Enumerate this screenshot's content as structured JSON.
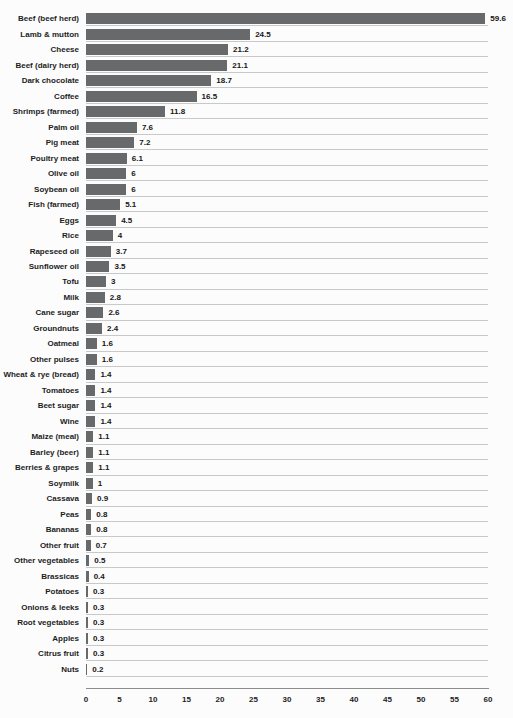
{
  "chart_data": {
    "type": "bar",
    "orientation": "horizontal",
    "title": "",
    "xlabel": "",
    "ylabel": "",
    "xlim": [
      0,
      60
    ],
    "x_ticks": [
      0,
      5,
      10,
      15,
      20,
      25,
      30,
      35,
      40,
      45,
      50,
      55,
      60
    ],
    "grid": "horizontal row separator lines only, no vertical gridlines",
    "legend_position": "none",
    "bar_color": "#68696b",
    "separator_color": "#c9c9c9",
    "axis_line_color": "#8d8d8d",
    "categories": [
      "Beef (beef herd)",
      "Lamb & mutton",
      "Cheese",
      "Beef (dairy herd)",
      "Dark chocolate",
      "Coffee",
      "Shrimps (farmed)",
      "Palm oil",
      "Pig meat",
      "Poultry meat",
      "Olive oil",
      "Soybean oil",
      "Fish (farmed)",
      "Eggs",
      "Rice",
      "Rapeseed oil",
      "Sunflower oil",
      "Tofu",
      "Milk",
      "Cane sugar",
      "Groundnuts",
      "Oatmeal",
      "Other pulses",
      "Wheat & rye (bread)",
      "Tomatoes",
      "Beet sugar",
      "Wine",
      "Maize (meal)",
      "Barley (beer)",
      "Berries & grapes",
      "Soymilk",
      "Cassava",
      "Peas",
      "Bananas",
      "Other fruit",
      "Other vegetables",
      "Brassicas",
      "Potatoes",
      "Onions & leeks",
      "Root vegetables",
      "Apples",
      "Citrus fruit",
      "Nuts"
    ],
    "values": [
      59.6,
      24.5,
      21.2,
      21.1,
      18.7,
      16.5,
      11.8,
      7.6,
      7.2,
      6.1,
      6,
      6,
      5.1,
      4.5,
      4,
      3.7,
      3.5,
      3,
      2.8,
      2.6,
      2.4,
      1.6,
      1.6,
      1.4,
      1.4,
      1.4,
      1.4,
      1.1,
      1.1,
      1.1,
      1,
      0.9,
      0.8,
      0.8,
      0.7,
      0.5,
      0.4,
      0.3,
      0.3,
      0.3,
      0.3,
      0.3,
      0.2
    ],
    "value_labels": [
      "59.6",
      "24.5",
      "21.2",
      "21.1",
      "18.7",
      "16.5",
      "11.8",
      "7.6",
      "7.2",
      "6.1",
      "6",
      "6",
      "5.1",
      "4.5",
      "4",
      "3.7",
      "3.5",
      "3",
      "2.8",
      "2.6",
      "2.4",
      "1.6",
      "1.6",
      "1.4",
      "1.4",
      "1.4",
      "1.4",
      "1.1",
      "1.1",
      "1.1",
      "1",
      "0.9",
      "0.8",
      "0.8",
      "0.7",
      "0.5",
      "0.4",
      "0.3",
      "0.3",
      "0.3",
      "0.3",
      "0.3",
      "0.2"
    ]
  }
}
